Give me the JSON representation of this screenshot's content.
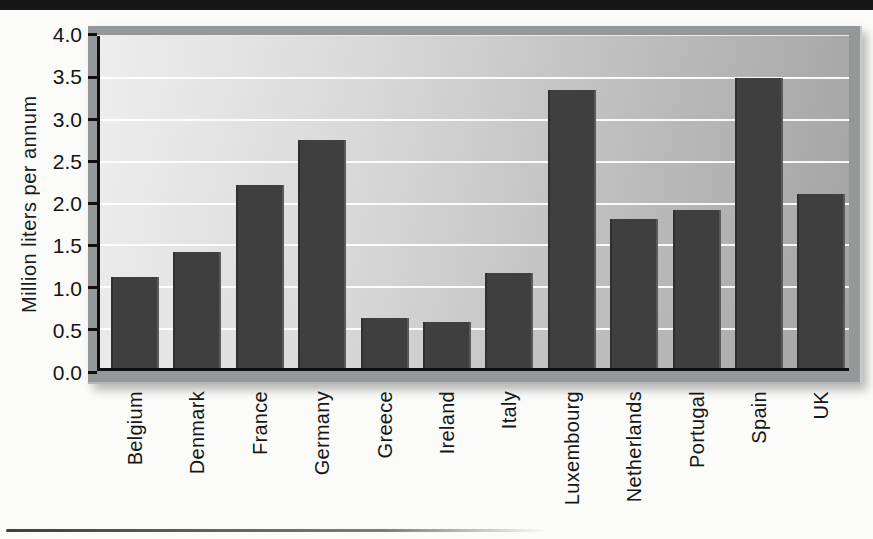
{
  "top_band": {
    "style": "cropped-title-band"
  },
  "chart_data": {
    "type": "bar",
    "title": "",
    "xlabel": "",
    "ylabel": "Million liters per annum",
    "categories": [
      "Belgium",
      "Denmark",
      "France",
      "Germany",
      "Greece",
      "Ireland",
      "Italy",
      "Luxembourg",
      "Netherlands",
      "Portugal",
      "Spain",
      "UK"
    ],
    "values": [
      1.1,
      1.4,
      2.2,
      2.75,
      0.6,
      0.55,
      1.15,
      3.35,
      1.8,
      1.9,
      3.5,
      2.1
    ],
    "ylim": [
      0,
      4
    ],
    "ytick_step": 0.5,
    "ytick_labels": [
      "0.0",
      "0.5",
      "1.0",
      "1.5",
      "2.0",
      "2.5",
      "3.0",
      "3.5",
      "4.0"
    ],
    "grid": "horizontal-white-lines",
    "legend": "none"
  },
  "colors": {
    "bar": "#3f3f3f",
    "plot_bg_left": "#eeeeee",
    "plot_bg_right": "#a3a3a3",
    "frame": "#949898",
    "gridline": "#ffffff",
    "axis": "#101010",
    "top_band": "#171717",
    "page_bg": "#fbfbf9"
  }
}
